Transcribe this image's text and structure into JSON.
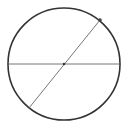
{
  "diagram": {
    "type": "circle-with-diameters",
    "canvas": {
      "width": 126,
      "height": 124,
      "background": "#ffffff"
    },
    "circle": {
      "cx": 64,
      "cy": 64,
      "r": 56,
      "stroke": "#333333",
      "stroke_width": 1.6
    },
    "horizontal_diameter": {
      "x1": 8,
      "y1": 64,
      "x2": 120,
      "y2": 64,
      "stroke": "#666666",
      "stroke_width": 0.9
    },
    "diagonal_diameter": {
      "x1": 29,
      "y1": 108,
      "x2": 100,
      "y2": 20,
      "stroke": "#666666",
      "stroke_width": 0.9
    },
    "center_point": {
      "cx": 64,
      "cy": 64,
      "r": 1.2,
      "fill": "#333333"
    },
    "endpoint": {
      "cx": 100,
      "cy": 20,
      "r": 1.8,
      "fill": "#444444"
    }
  }
}
